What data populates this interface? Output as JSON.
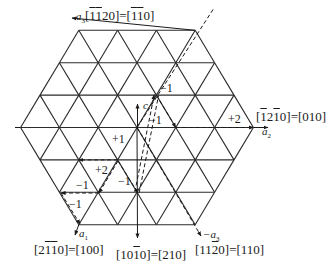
{
  "diagram": {
    "type": "hexagonal-lattice-basal-plane",
    "colors": {
      "line": "#2a2a2a",
      "background": "#ffffff"
    },
    "axes": {
      "a1": {
        "label": "a",
        "sub": "1",
        "direction": "[2̄1̄1̄0]=[100]"
      },
      "a2": {
        "label": "a",
        "sub": "2",
        "direction": "[1̄2 1̄0]=[010]"
      },
      "a3": {
        "label": "a",
        "sub": "3",
        "direction": "[1̄1̄20]=[1̄1̄0]"
      },
      "neg_a3": {
        "label": "−a",
        "sub": "3",
        "direction": "[112̄0]=[110]"
      },
      "c": {
        "label": "c"
      },
      "down": {
        "direction": "[101̄0]=[210]"
      }
    },
    "labels": {
      "a3_dir": {
        "prefix": "[",
        "parts": [
          [
            "1",
            "o"
          ],
          [
            "1",
            "o"
          ],
          [
            "2",
            ""
          ],
          [
            "0",
            ""
          ]
        ],
        "eq": "]=[",
        "parts2": [
          [
            "1",
            "o"
          ],
          [
            "1",
            "o"
          ],
          [
            "0",
            ""
          ]
        ],
        "suffix": "]"
      },
      "a2_dir_text": "[ı̄2ı̄0]=[010]",
      "a1_dir_text": "[2ı̄ı̄0]=[100]",
      "down_dir_text": "[10ı̄0]=[210]",
      "neg_a3_dir_text": "[112̄0]=[110]"
    },
    "step_labels": [
      {
        "text": "−1",
        "x": 160,
        "y": 82
      },
      {
        "text": "−1",
        "x": 149,
        "y": 114
      },
      {
        "text": "+2",
        "x": 228,
        "y": 113
      },
      {
        "text": "+1",
        "x": 112,
        "y": 133
      },
      {
        "text": "+2",
        "x": 95,
        "y": 164
      },
      {
        "text": "−1",
        "x": 76,
        "y": 179
      },
      {
        "text": "−1",
        "x": 118,
        "y": 175
      },
      {
        "text": "−1",
        "x": 69,
        "y": 198
      }
    ]
  }
}
